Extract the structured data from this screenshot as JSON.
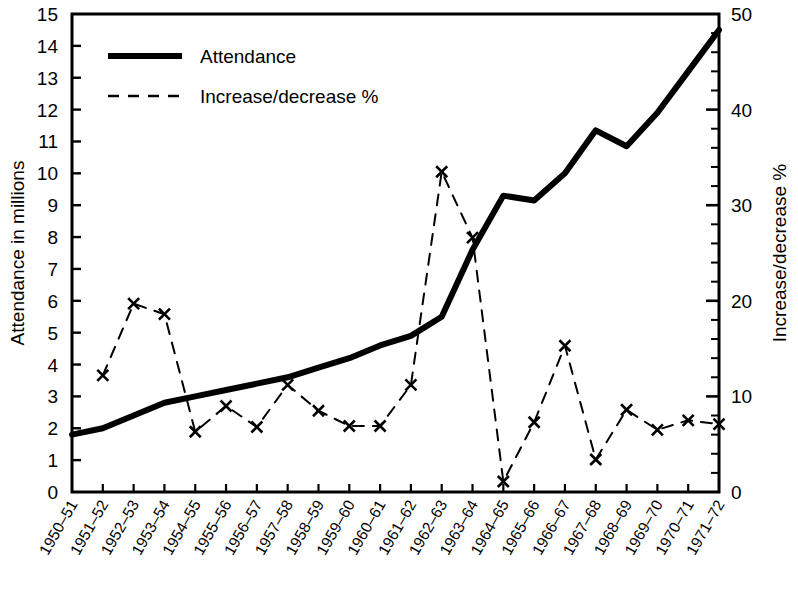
{
  "chart_data": {
    "type": "line",
    "title": "",
    "subtitle": "",
    "xlabel": "",
    "ylabel": "Attendance in millions",
    "y2label": "Increase/decrease %",
    "grid": false,
    "legend_position": "top-left",
    "ylim": [
      0,
      15
    ],
    "y2lim": [
      0,
      50
    ],
    "yticks": [
      0,
      1,
      2,
      3,
      4,
      5,
      6,
      7,
      8,
      9,
      10,
      11,
      12,
      13,
      14,
      15
    ],
    "ytick_labels": [
      "0",
      "1",
      "2",
      "3",
      "4",
      "5",
      "6",
      "7",
      "8",
      "9",
      "10",
      "11",
      "12",
      "13",
      "14",
      "15"
    ],
    "y2ticks": [
      0,
      10,
      20,
      30,
      40,
      50
    ],
    "y2tick_labels": [
      "0",
      "10",
      "20",
      "30",
      "40",
      "50"
    ],
    "y2_minor_tick_step": 2,
    "categories": [
      "1950–51",
      "1951–52",
      "1952–53",
      "1953–54",
      "1954–55",
      "1955–56",
      "1956–57",
      "1957–58",
      "1958–59",
      "1959–60",
      "1960–61",
      "1961–62",
      "1962–63",
      "1963–64",
      "1964–65",
      "1965–66",
      "1966–67",
      "1967–68",
      "1968–69",
      "1969–70",
      "1970–71",
      "1971–72"
    ],
    "series": [
      {
        "name": "Attendance",
        "axis": "left",
        "style": "solid",
        "marker": "none",
        "color": "#000000",
        "width": 6,
        "unit": "millions",
        "values": [
          1.8,
          2.0,
          2.4,
          2.8,
          3.0,
          3.2,
          3.4,
          3.6,
          3.9,
          4.2,
          4.6,
          4.9,
          5.5,
          7.6,
          9.3,
          9.15,
          10.0,
          11.35,
          10.85,
          11.9,
          13.2,
          14.5
        ]
      },
      {
        "name": "Increase/decrease %",
        "axis": "right",
        "style": "dashed",
        "marker": "x",
        "color": "#000000",
        "width": 2,
        "unit": "percent",
        "values": [
          null,
          12.2,
          19.7,
          18.6,
          6.3,
          9.0,
          6.8,
          11.2,
          8.5,
          6.9,
          6.9,
          11.2,
          33.5,
          26.6,
          1.1,
          7.3,
          15.3,
          3.4,
          8.6,
          6.5,
          7.5,
          7.1
        ]
      }
    ],
    "legend": [
      {
        "label": "Attendance",
        "style": "solid"
      },
      {
        "label": "Increase/decrease %",
        "style": "dashed"
      }
    ]
  }
}
